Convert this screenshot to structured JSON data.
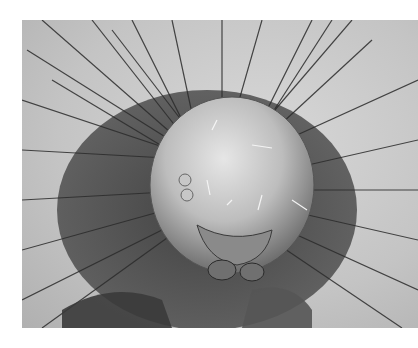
{
  "image": {
    "subject": "scanning electron micrograph of a caterpillar head with bristles",
    "palette": {
      "background": "#ffffff",
      "light": "#d8d8d8",
      "mid": "#8a8a8a",
      "dark": "#1e1e1e"
    }
  }
}
